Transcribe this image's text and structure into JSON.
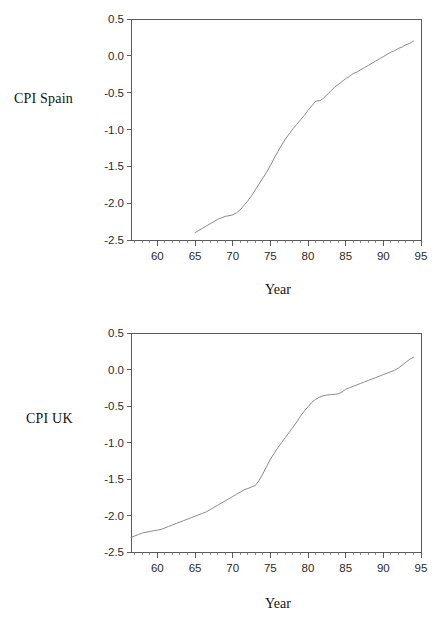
{
  "figures": [
    {
      "id": "spain",
      "ylabel": "CPI Spain",
      "xlabel": "Year"
    },
    {
      "id": "uk",
      "ylabel": "CPI UK",
      "xlabel": "Year"
    }
  ],
  "chart_data": [
    {
      "type": "line",
      "title": "",
      "xlabel": "Year",
      "ylabel": "CPI Spain",
      "xlim": [
        56.5,
        95
      ],
      "ylim": [
        -2.5,
        0.5
      ],
      "xticks": [
        60,
        65,
        70,
        75,
        80,
        85,
        90,
        95
      ],
      "xtick_labels": [
        "60",
        "65",
        "70",
        "75",
        "80",
        "85",
        "90",
        "95"
      ],
      "yticks": [
        -2.5,
        -2.0,
        -1.5,
        -1.0,
        -0.5,
        0.0,
        0.5
      ],
      "ytick_labels": [
        "-2.5",
        "-2.0",
        "-1.5",
        "-1.0",
        "-0.5",
        "0.0",
        "0.5"
      ],
      "grid": false,
      "legend": null,
      "series": [
        {
          "name": "CPI Spain",
          "color": "#8a8a8a",
          "x": [
            65.0,
            65.5,
            66.0,
            66.5,
            67.0,
            67.5,
            68.0,
            68.5,
            69.0,
            69.5,
            70.0,
            70.5,
            71.0,
            71.5,
            72.0,
            72.5,
            73.0,
            73.5,
            74.0,
            74.5,
            75.0,
            75.5,
            76.0,
            76.5,
            77.0,
            77.5,
            78.0,
            78.5,
            79.0,
            79.5,
            80.0,
            80.5,
            81.0,
            81.3,
            81.6,
            82.0,
            82.5,
            83.0,
            83.5,
            84.0,
            84.5,
            85.0,
            85.5,
            86.0,
            86.5,
            87.0,
            87.5,
            88.0,
            88.5,
            89.0,
            89.5,
            90.0,
            90.5,
            91.0,
            91.5,
            92.0,
            92.5,
            93.0,
            93.5,
            94.0
          ],
          "y": [
            -2.4,
            -2.37,
            -2.34,
            -2.31,
            -2.28,
            -2.25,
            -2.22,
            -2.2,
            -2.18,
            -2.17,
            -2.16,
            -2.13,
            -2.09,
            -2.03,
            -1.97,
            -1.9,
            -1.82,
            -1.74,
            -1.66,
            -1.58,
            -1.49,
            -1.39,
            -1.3,
            -1.21,
            -1.13,
            -1.06,
            -0.99,
            -0.93,
            -0.87,
            -0.81,
            -0.74,
            -0.68,
            -0.62,
            -0.61,
            -0.61,
            -0.58,
            -0.53,
            -0.48,
            -0.43,
            -0.39,
            -0.35,
            -0.31,
            -0.28,
            -0.24,
            -0.22,
            -0.19,
            -0.16,
            -0.13,
            -0.1,
            -0.07,
            -0.04,
            -0.01,
            0.02,
            0.05,
            0.07,
            0.1,
            0.12,
            0.15,
            0.17,
            0.2
          ]
        }
      ]
    },
    {
      "type": "line",
      "title": "",
      "xlabel": "Year",
      "ylabel": "CPI UK",
      "xlim": [
        56.5,
        95
      ],
      "ylim": [
        -2.5,
        0.5
      ],
      "xticks": [
        60,
        65,
        70,
        75,
        80,
        85,
        90,
        95
      ],
      "xtick_labels": [
        "60",
        "65",
        "70",
        "75",
        "80",
        "85",
        "90",
        "95"
      ],
      "yticks": [
        -2.5,
        -2.0,
        -1.5,
        -1.0,
        -0.5,
        0.0,
        0.5
      ],
      "ytick_labels": [
        "-2.5",
        "-2.0",
        "-1.5",
        "-1.0",
        "-0.5",
        "0.0",
        "0.5"
      ],
      "grid": false,
      "legend": null,
      "series": [
        {
          "name": "CPI UK",
          "color": "#8a8a8a",
          "x": [
            56.5,
            57.0,
            57.5,
            58.0,
            58.5,
            59.0,
            59.5,
            60.0,
            60.5,
            61.0,
            61.5,
            62.0,
            62.5,
            63.0,
            63.5,
            64.0,
            64.5,
            65.0,
            65.5,
            66.0,
            66.5,
            67.0,
            67.5,
            68.0,
            68.5,
            69.0,
            69.5,
            70.0,
            70.5,
            71.0,
            71.5,
            72.0,
            72.5,
            73.0,
            73.5,
            74.0,
            74.5,
            75.0,
            75.5,
            76.0,
            76.5,
            77.0,
            77.5,
            78.0,
            78.5,
            79.0,
            79.5,
            80.0,
            80.5,
            81.0,
            81.5,
            82.0,
            82.5,
            83.0,
            83.5,
            84.0,
            84.5,
            85.0,
            85.5,
            86.0,
            86.5,
            87.0,
            87.5,
            88.0,
            88.5,
            89.0,
            89.5,
            90.0,
            90.5,
            91.0,
            91.5,
            92.0,
            92.5,
            93.0,
            93.5,
            94.0
          ],
          "y": [
            -2.3,
            -2.28,
            -2.26,
            -2.24,
            -2.23,
            -2.22,
            -2.21,
            -2.2,
            -2.19,
            -2.17,
            -2.15,
            -2.13,
            -2.11,
            -2.09,
            -2.07,
            -2.05,
            -2.03,
            -2.01,
            -1.99,
            -1.97,
            -1.95,
            -1.92,
            -1.89,
            -1.86,
            -1.83,
            -1.8,
            -1.77,
            -1.74,
            -1.71,
            -1.68,
            -1.65,
            -1.63,
            -1.61,
            -1.59,
            -1.52,
            -1.43,
            -1.33,
            -1.23,
            -1.15,
            -1.07,
            -1.0,
            -0.93,
            -0.86,
            -0.79,
            -0.72,
            -0.64,
            -0.57,
            -0.51,
            -0.45,
            -0.41,
            -0.38,
            -0.36,
            -0.35,
            -0.345,
            -0.34,
            -0.335,
            -0.31,
            -0.27,
            -0.25,
            -0.23,
            -0.21,
            -0.19,
            -0.17,
            -0.15,
            -0.13,
            -0.11,
            -0.09,
            -0.07,
            -0.05,
            -0.03,
            -0.01,
            0.02,
            0.06,
            0.1,
            0.14,
            0.17
          ]
        }
      ]
    }
  ]
}
